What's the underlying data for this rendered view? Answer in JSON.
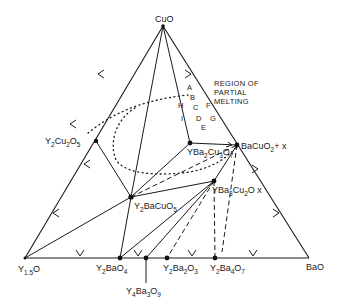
{
  "diagram": {
    "vertices": {
      "top": {
        "label": "CuO",
        "x": 163,
        "y": 26
      },
      "bottom_left": {
        "label_main": "Y",
        "label_sub": "1.5",
        "label_tail": "O",
        "x": 25,
        "y": 258
      },
      "bottom_right": {
        "label": "BaO",
        "x": 309,
        "y": 258
      }
    },
    "phases": [
      {
        "id": "y2cu2o5",
        "parts": [
          "Y",
          "2",
          "Cu",
          "2",
          "O",
          "5"
        ],
        "x": 96,
        "y": 141
      },
      {
        "id": "ybco",
        "parts": [
          "YBa",
          "2",
          "Cu",
          "3",
          "O",
          "7"
        ],
        "x": 190,
        "y": 143
      },
      {
        "id": "bacuo2",
        "parts": [
          "BaCuO",
          "2",
          "+ x"
        ],
        "x": 237,
        "y": 145
      },
      {
        "id": "yba3cu2ox",
        "parts": [
          "YBa",
          "3",
          "Cu",
          "2",
          "O x"
        ],
        "x": 214,
        "y": 181
      },
      {
        "id": "y2bacuo5",
        "parts": [
          "Y",
          "2",
          "BaCuO",
          "5"
        ],
        "x": 131,
        "y": 197
      },
      {
        "id": "y2bao4",
        "parts": [
          "Y",
          "2",
          "BaO",
          "4"
        ],
        "x": 120,
        "y": 258
      },
      {
        "id": "y4ba3o9",
        "parts": [
          "Y",
          "4",
          "Ba",
          "3",
          "O",
          "9"
        ],
        "x": 146,
        "y": 258
      },
      {
        "id": "y2ba2o3",
        "parts": [
          "Y",
          "2",
          "Ba",
          "2",
          "O",
          "3"
        ],
        "x": 167,
        "y": 258
      },
      {
        "id": "y2ba4o7",
        "parts": [
          "Y",
          "2",
          "Ba",
          "4",
          "O",
          "7"
        ],
        "x": 215,
        "y": 258
      }
    ],
    "region_label": [
      "REGION OF",
      "PARTIAL",
      "MELTING"
    ],
    "region_points": [
      "A",
      "B",
      "C",
      "D",
      "E",
      "F",
      "G",
      "H",
      "I"
    ],
    "colors": {
      "ink": "#1a1a1a",
      "background": "#ffffff"
    }
  }
}
